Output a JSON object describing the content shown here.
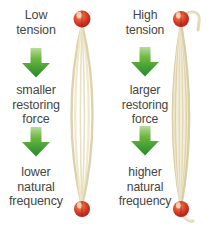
{
  "figure": {
    "background_color": "#ffffff",
    "text_color": "#454545",
    "arrow_color_light": "#7fc24a",
    "arrow_color_dark": "#2f8c2f",
    "string_color": "#e4dcb8",
    "bead_color": "#d93a2b"
  },
  "columns": [
    {
      "id": "low-tension",
      "captions": {
        "top": "Low\ntension",
        "middle": "smaller\nrestoring\nforce",
        "bottom": "lower\nnatural\nfrequency"
      },
      "arrows": [
        {
          "name": "arrow-down-1",
          "direction": "down"
        },
        {
          "name": "arrow-down-2",
          "direction": "down"
        }
      ],
      "illustration": {
        "name": "loose-string-bundle",
        "description": "Loosely strung slack strings bowed outward between two red beads",
        "strand_count": 4,
        "tension_state": "low",
        "bead_top": "red-bead",
        "bead_bottom": "red-bead"
      }
    },
    {
      "id": "high-tension",
      "captions": {
        "top": "High\ntension",
        "middle": "larger\nrestoring\nforce",
        "bottom": "higher\nnatural\nfrequency"
      },
      "arrows": [
        {
          "name": "arrow-down-1",
          "direction": "down"
        },
        {
          "name": "arrow-down-2",
          "direction": "down"
        }
      ],
      "illustration": {
        "name": "taut-string-bundle",
        "description": "Tightly packed taut strings between two red beads with hook at top and loose tail at bottom",
        "strand_count": 9,
        "tension_state": "high",
        "bead_top": "red-bead",
        "bead_bottom": "red-bead"
      }
    }
  ]
}
